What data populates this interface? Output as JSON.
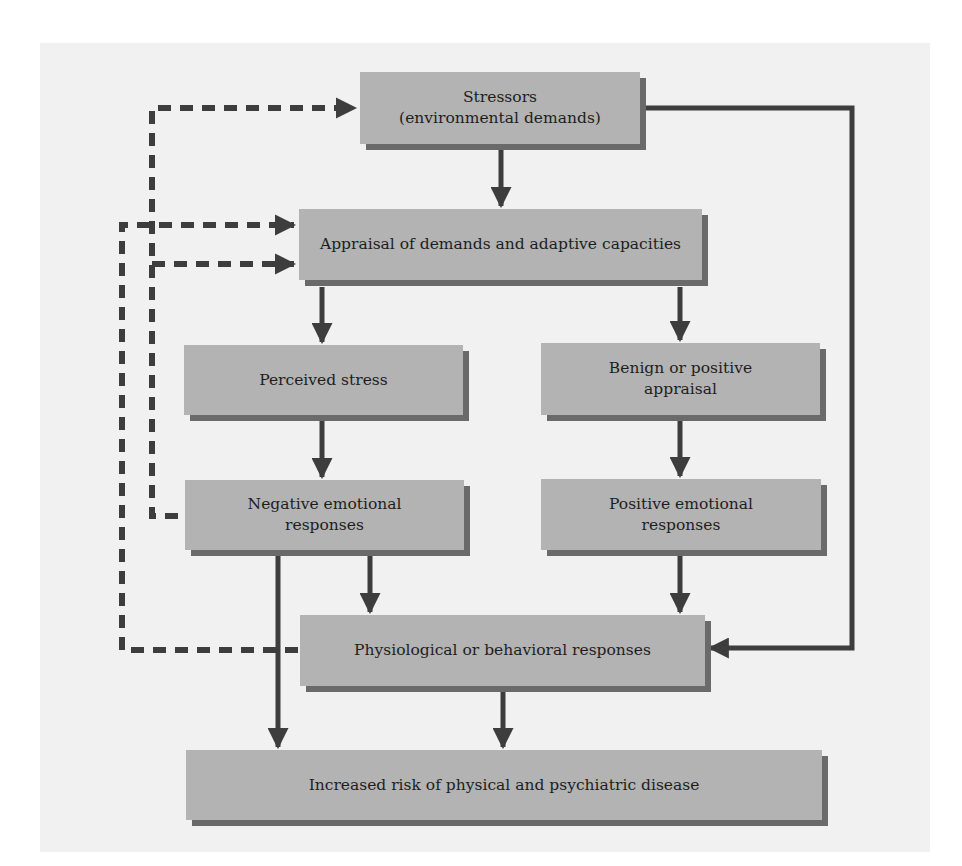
{
  "diagram": {
    "colors": {
      "panel_background": "#f1f1f1",
      "box_fill": "#b3b3b3",
      "box_shadow": "#6a6a6a",
      "line": "#3d3d3d",
      "text": "#1e1e1e"
    },
    "nodes": {
      "stressors": {
        "line1": "Stressors",
        "line2": "(environmental demands)"
      },
      "appraisal": {
        "label": "Appraisal of demands and adaptive capacities"
      },
      "perceived_stress": {
        "label": "Perceived stress"
      },
      "benign_appraisal": {
        "line1": "Benign or positive",
        "line2": "appraisal"
      },
      "negative_emotional": {
        "line1": "Negative emotional",
        "line2": "responses"
      },
      "positive_emotional": {
        "line1": "Positive emotional",
        "line2": "responses"
      },
      "physiological": {
        "label": "Physiological or behavioral responses"
      },
      "disease_risk": {
        "label": "Increased risk of physical and psychiatric disease"
      }
    },
    "edges": [
      {
        "from": "stressors",
        "to": "appraisal",
        "style": "solid"
      },
      {
        "from": "stressors",
        "to": "physiological",
        "style": "solid"
      },
      {
        "from": "appraisal",
        "to": "perceived_stress",
        "style": "solid"
      },
      {
        "from": "appraisal",
        "to": "benign_appraisal",
        "style": "solid"
      },
      {
        "from": "perceived_stress",
        "to": "negative_emotional",
        "style": "solid"
      },
      {
        "from": "benign_appraisal",
        "to": "positive_emotional",
        "style": "solid"
      },
      {
        "from": "negative_emotional",
        "to": "physiological",
        "style": "solid"
      },
      {
        "from": "negative_emotional",
        "to": "disease_risk",
        "style": "solid"
      },
      {
        "from": "positive_emotional",
        "to": "physiological",
        "style": "solid"
      },
      {
        "from": "physiological",
        "to": "disease_risk",
        "style": "solid"
      },
      {
        "from": "negative_emotional",
        "to": "stressors",
        "style": "dashed"
      },
      {
        "from": "negative_emotional",
        "to": "appraisal",
        "style": "dashed"
      },
      {
        "from": "physiological",
        "to": "appraisal",
        "style": "dashed"
      }
    ]
  }
}
